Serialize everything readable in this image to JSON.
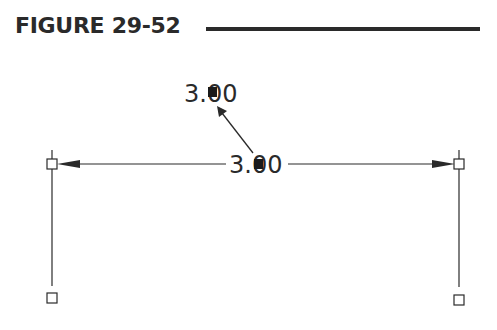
{
  "figure": {
    "title": "FIGURE 29-52"
  },
  "diagram": {
    "dimension_text": "3.00",
    "moved_text": "3.00",
    "colors": {
      "ink": "#2a2a2a",
      "background": "#ffffff"
    },
    "left_extension_line": {
      "x": 52,
      "y1": 150,
      "y2": 286
    },
    "right_extension_line": {
      "x": 459,
      "y1": 150,
      "y2": 287
    },
    "dimension_line": {
      "y": 164,
      "x1": 57,
      "x2": 455
    },
    "grips": [
      {
        "name": "left-dimline-grip",
        "x": 47,
        "y": 159,
        "size": 10,
        "filled": false
      },
      {
        "name": "right-dimline-grip",
        "x": 454,
        "y": 159,
        "size": 10,
        "filled": false
      },
      {
        "name": "left-origin-grip",
        "x": 47,
        "y": 293,
        "size": 10,
        "filled": false
      },
      {
        "name": "right-origin-grip",
        "x": 454,
        "y": 295,
        "size": 10,
        "filled": false
      },
      {
        "name": "text-grip",
        "x": 254,
        "y": 159,
        "size": 9,
        "filled": true
      },
      {
        "name": "moved-text-grip",
        "x": 208,
        "y": 87,
        "size": 9,
        "filled": true
      }
    ]
  }
}
